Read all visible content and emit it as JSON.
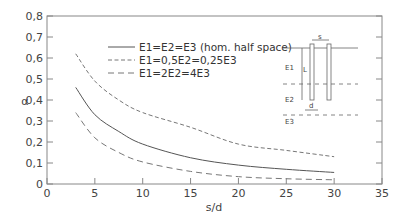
{
  "chart_data": {
    "type": "line",
    "title": "",
    "xlabel": "s/d",
    "ylabel": "α",
    "xlim": [
      0,
      35
    ],
    "ylim": [
      0,
      0.8
    ],
    "xticks": [
      "0",
      "5",
      "10",
      "15",
      "20",
      "25",
      "30",
      "35"
    ],
    "yticks": [
      "0",
      "0,1",
      "0,2",
      "0,3",
      "0,4",
      "0,5",
      "0,6",
      "0,7",
      "0,8"
    ],
    "grid": false,
    "legend_position": "upper right (inside)",
    "x": [
      3,
      5,
      7.5,
      10,
      15,
      20,
      25,
      30
    ],
    "series": [
      {
        "name": "E1=E2=E3 (hom. half space)",
        "style": "solid",
        "values": [
          0.46,
          0.33,
          0.25,
          0.19,
          0.125,
          0.09,
          0.07,
          0.055
        ]
      },
      {
        "name": "E1=0,5E2=0,25E3",
        "style": "dashed-fine",
        "values": [
          0.62,
          0.49,
          0.4,
          0.34,
          0.27,
          0.19,
          0.16,
          0.13
        ]
      },
      {
        "name": "E1=2E2=4E3",
        "style": "dashed-coarse",
        "values": [
          0.34,
          0.22,
          0.15,
          0.105,
          0.06,
          0.035,
          0.025,
          0.02
        ]
      }
    ],
    "annotations": {
      "inset_labels": [
        "s",
        "L",
        "d",
        "E1",
        "E2",
        "E3"
      ]
    }
  },
  "legend": [
    {
      "label": "E1=E2=E3 (hom. half space)"
    },
    {
      "label": "E1=0,5E2=0,25E3"
    },
    {
      "label": "E1=2E2=4E3"
    }
  ],
  "inset": {
    "s": "s",
    "L": "L",
    "d": "d",
    "E1": "E1",
    "E2": "E2",
    "E3": "E3"
  }
}
